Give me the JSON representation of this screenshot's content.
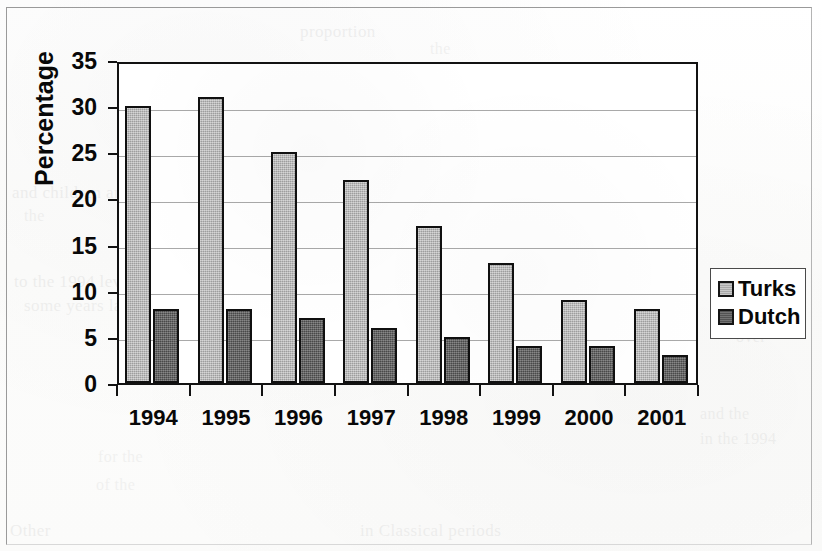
{
  "figure": {
    "kind": "scanned-bar-chart"
  },
  "chart_data": {
    "type": "bar",
    "title": "",
    "subtitle": "",
    "xlabel": "",
    "ylabel": "Percentage",
    "categories": [
      "1994",
      "1995",
      "1996",
      "1997",
      "1998",
      "1999",
      "2000",
      "2001"
    ],
    "series": [
      {
        "name": "Turks",
        "color": "#b2b2b2",
        "values": [
          30,
          31,
          25,
          22,
          17,
          13,
          9,
          8
        ]
      },
      {
        "name": "Dutch",
        "color": "#5c5c5c",
        "values": [
          8,
          8,
          7,
          6,
          5,
          4,
          4,
          3
        ]
      }
    ],
    "ylim": [
      0,
      35
    ],
    "ytick_step": 5,
    "yticks": [
      0,
      5,
      10,
      15,
      20,
      25,
      30,
      35
    ],
    "ytick_labels": [
      "0",
      "5",
      "10",
      "15",
      "20",
      "25",
      "30",
      "35"
    ],
    "grid": true,
    "grid_axis": "y",
    "legend_position": "right",
    "legend_entries": [
      "Turks",
      "Dutch"
    ],
    "annotations": []
  },
  "ghost_text": [
    {
      "text": "proportion",
      "x": 300,
      "y": 22,
      "size": 17,
      "opacity": 0.05
    },
    {
      "text": "the",
      "x": 430,
      "y": 40,
      "size": 16,
      "opacity": 0.045
    },
    {
      "text": "and children among the",
      "x": 12,
      "y": 183,
      "size": 17,
      "opacity": 0.05
    },
    {
      "text": "the",
      "x": 24,
      "y": 207,
      "size": 16,
      "opacity": 0.045
    },
    {
      "text": "to the 1994 level, and in",
      "x": 14,
      "y": 272,
      "size": 17,
      "opacity": 0.05
    },
    {
      "text": "some years later",
      "x": 24,
      "y": 296,
      "size": 17,
      "opacity": 0.048
    },
    {
      "text": "over",
      "x": 736,
      "y": 328,
      "size": 16,
      "opacity": 0.042
    },
    {
      "text": "and the",
      "x": 700,
      "y": 405,
      "size": 16,
      "opacity": 0.045
    },
    {
      "text": "in the 1994",
      "x": 700,
      "y": 430,
      "size": 16,
      "opacity": 0.042
    },
    {
      "text": "for the",
      "x": 98,
      "y": 448,
      "size": 16,
      "opacity": 0.04
    },
    {
      "text": "of the",
      "x": 96,
      "y": 476,
      "size": 16,
      "opacity": 0.04
    },
    {
      "text": "Other",
      "x": 10,
      "y": 521,
      "size": 17,
      "opacity": 0.05
    },
    {
      "text": "in Classical periods",
      "x": 360,
      "y": 521,
      "size": 17,
      "opacity": 0.048
    }
  ]
}
